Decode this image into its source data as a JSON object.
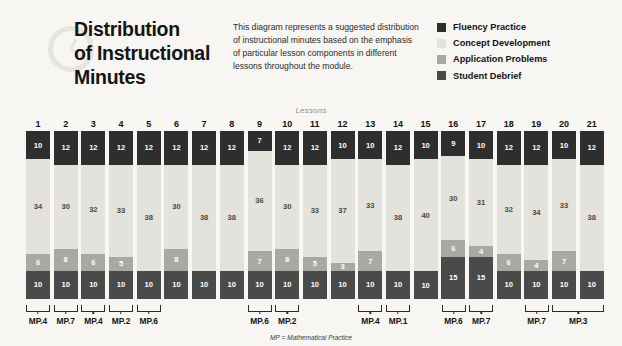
{
  "header": {
    "title_lines": [
      "Distribution",
      "of Instructional",
      "Minutes"
    ],
    "clock_icon": "clock-icon",
    "intro": "This diagram represents a suggested distribution of instructional minutes based on the emphasis of particular lesson components in different lessons throughout the module."
  },
  "legend": {
    "items": [
      {
        "label": "Fluency Practice",
        "color": "#2e2e2e"
      },
      {
        "label": "Concept Development",
        "color": "#e3e2dd"
      },
      {
        "label": "Application Problems",
        "color": "#a8a8a5"
      },
      {
        "label": "Student Debrief",
        "color": "#4a4a4a"
      }
    ]
  },
  "chart_data": {
    "type": "bar",
    "title": "Distribution of Instructional Minutes",
    "subtitle": "Lessons",
    "xlabel": "Lessons",
    "ylabel": "",
    "stacked": true,
    "grid": false,
    "legend_position": "top-right",
    "ylim": [
      0,
      60
    ],
    "categories": [
      "1",
      "2",
      "3",
      "4",
      "5",
      "6",
      "7",
      "8",
      "9",
      "10",
      "11",
      "12",
      "13",
      "14",
      "15",
      "16",
      "17",
      "18",
      "19",
      "20",
      "21"
    ],
    "series": [
      {
        "name": "Fluency Practice",
        "color": "#2e2e2e",
        "values": [
          10,
          12,
          12,
          12,
          12,
          12,
          12,
          12,
          7,
          12,
          12,
          10,
          10,
          12,
          10,
          9,
          10,
          12,
          12,
          10,
          12
        ]
      },
      {
        "name": "Concept Development",
        "color": "#e3e2dd",
        "values": [
          34,
          30,
          32,
          33,
          38,
          30,
          38,
          38,
          36,
          30,
          33,
          37,
          33,
          38,
          40,
          30,
          31,
          32,
          34,
          33,
          38
        ]
      },
      {
        "name": "Application Problems",
        "color": "#a8a8a5",
        "values": [
          6,
          8,
          6,
          5,
          0,
          8,
          0,
          0,
          7,
          8,
          5,
          3,
          7,
          0,
          0,
          6,
          4,
          6,
          4,
          7,
          0
        ]
      },
      {
        "name": "Student Debrief",
        "color": "#4a4a4a",
        "values": [
          10,
          10,
          10,
          10,
          10,
          10,
          10,
          10,
          10,
          10,
          10,
          10,
          10,
          10,
          10,
          15,
          15,
          10,
          10,
          10,
          10
        ]
      }
    ],
    "annotations": [
      {
        "label": "MP.4",
        "lessons": [
          1
        ]
      },
      {
        "label": "MP.7",
        "lessons": [
          2
        ]
      },
      {
        "label": "MP.4",
        "lessons": [
          3
        ]
      },
      {
        "label": "MP.2",
        "lessons": [
          4
        ]
      },
      {
        "label": "MP.6",
        "lessons": [
          5
        ]
      },
      {
        "label": "MP.6",
        "lessons": [
          9
        ]
      },
      {
        "label": "MP.2",
        "lessons": [
          10
        ]
      },
      {
        "label": "MP.4",
        "lessons": [
          13
        ]
      },
      {
        "label": "MP.1",
        "lessons": [
          14
        ]
      },
      {
        "label": "MP.6",
        "lessons": [
          16
        ]
      },
      {
        "label": "MP.7",
        "lessons": [
          17
        ]
      },
      {
        "label": "MP.7",
        "lessons": [
          19
        ]
      },
      {
        "label": "MP.3",
        "lessons": [
          20,
          21
        ]
      }
    ],
    "footnote": "MP = Mathematical Practice"
  }
}
